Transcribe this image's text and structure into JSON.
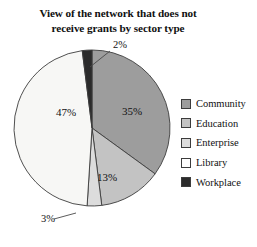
{
  "chart_data": {
    "type": "pie",
    "title": "View of the network that does not receive grants by sector type",
    "title_lines": [
      "View of the network that does not",
      "receive grants by sector type"
    ],
    "xlabel": "",
    "ylabel": "",
    "grid": false,
    "legend_position": "right",
    "start_angle_deg": -90,
    "direction": "clockwise",
    "categories": [
      "Community",
      "Education",
      "Enterprise",
      "Library",
      "Workplace"
    ],
    "values": [
      35,
      13,
      3,
      47,
      2
    ],
    "value_labels": [
      "35%",
      "13%",
      "3%",
      "47%",
      "2%"
    ],
    "colors": [
      "#9d9d9d",
      "#c3c3c3",
      "#dcdcdc",
      "#f7f7f5",
      "#2b2b2b"
    ],
    "slice_border_color": "#3c3c3c",
    "slices": [
      {
        "name": "Community",
        "value": 35,
        "label": "35%",
        "color": "#9d9d9d",
        "label_placement": "inside",
        "label_x": 122,
        "label_y": 79
      },
      {
        "name": "Education",
        "value": 13,
        "label": "13%",
        "color": "#c3c3c3",
        "label_placement": "inside",
        "label_x": 97,
        "label_y": 145
      },
      {
        "name": "Enterprise",
        "value": 3,
        "label": "3%",
        "color": "#dcdcdc",
        "label_placement": "callout",
        "label_x": 41,
        "label_y": 186,
        "leader_from_x": 76,
        "leader_from_y": 177,
        "leader_to_x": 54,
        "leader_to_y": 183
      },
      {
        "name": "Library",
        "value": 47,
        "label": "47%",
        "color": "#f7f7f5",
        "label_placement": "inside",
        "label_x": 56,
        "label_y": 80
      },
      {
        "name": "Workplace",
        "value": 2,
        "label": "2%",
        "color": "#2b2b2b",
        "label_placement": "callout",
        "label_x": 113,
        "label_y": 12,
        "leader_from_x": 90,
        "leader_from_y": 31,
        "leader_to_x": 110,
        "leader_to_y": 15
      }
    ]
  },
  "legend": {
    "items": [
      {
        "label": "Community",
        "color": "#9d9d9d"
      },
      {
        "label": "Education",
        "color": "#c3c3c3"
      },
      {
        "label": "Enterprise",
        "color": "#dcdcdc"
      },
      {
        "label": "Library",
        "color": "#fdfdfd"
      },
      {
        "label": "Workplace",
        "color": "#2b2b2b"
      }
    ]
  }
}
